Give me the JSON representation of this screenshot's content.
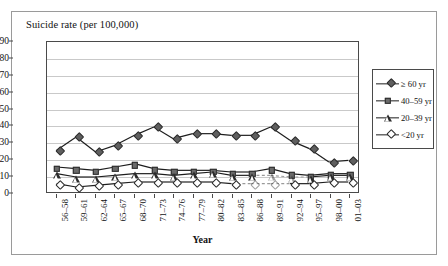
{
  "figure": {
    "y_axis_title": "Suicide rate (per 100,000)",
    "x_axis_title": "Year"
  },
  "legend": {
    "position": "right",
    "items": [
      {
        "label": "≥ 60 yr",
        "marker": "diamond-filled",
        "key": "ge60"
      },
      {
        "label": "40–59 yr",
        "marker": "square-filled",
        "key": "a4059"
      },
      {
        "label": "20–39 yr",
        "marker": "triangle-open",
        "key": "a2039"
      },
      {
        "label": "<20 yr",
        "marker": "diamond-open",
        "key": "lt20"
      }
    ]
  },
  "chart_data": {
    "type": "line",
    "title": "",
    "xlabel": "Year",
    "ylabel": "Suicide rate (per 100,000)",
    "ylim": [
      0,
      90
    ],
    "yticks": [
      0,
      10,
      20,
      30,
      40,
      50,
      60,
      70,
      80,
      90
    ],
    "grid": true,
    "categories": [
      "56–58",
      "59–61",
      "62–64",
      "65–67",
      "68–70",
      "71–73",
      "74–76",
      "77–79",
      "80–82",
      "83–85",
      "86–88",
      "89–91",
      "92–94",
      "95–97",
      "98–00",
      "01–03"
    ],
    "series": [
      {
        "name": "≥ 60 yr",
        "marker": "diamond-filled",
        "values": [
          25,
          33,
          24,
          28,
          34,
          39,
          32,
          35,
          35,
          34,
          34,
          39,
          31,
          26,
          18,
          19
        ],
        "dashed_from": null
      },
      {
        "name": "40–59 yr",
        "marker": "square-filled",
        "values": [
          15,
          14,
          13,
          15,
          17,
          14,
          13,
          13,
          13,
          12,
          12,
          14,
          11,
          10,
          11,
          11
        ],
        "dashed_from": null
      },
      {
        "name": "20–39 yr",
        "marker": "triangle-open",
        "values": [
          11,
          9,
          9,
          10,
          11,
          11,
          10,
          11,
          12,
          10,
          10,
          10,
          9,
          9,
          10,
          10
        ],
        "dashed_from": 10
      },
      {
        "name": "<20 yr",
        "marker": "diamond-open",
        "values": [
          5,
          3,
          4,
          5,
          6,
          6,
          6,
          6,
          6,
          5,
          5,
          5,
          5,
          5,
          6,
          6
        ],
        "dashed_from": 9
      }
    ]
  }
}
